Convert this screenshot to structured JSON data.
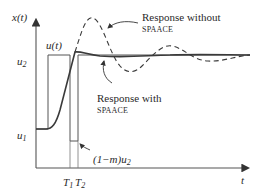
{
  "diagram": {
    "axes": {
      "y_label": "x(t)",
      "x_label": "t"
    },
    "levels": {
      "upper": "u2",
      "lower": "u1",
      "dip": "(1−m)u2"
    },
    "time_marks": [
      "T1",
      "T2"
    ],
    "signal_label": "u(t)",
    "annotations": {
      "without": {
        "line1": "Response without",
        "line2": "SPAACE"
      },
      "with": {
        "line1": "Response with",
        "line2": "SPAACE"
      }
    },
    "colors": {
      "line": "#3a3a3a",
      "axis": "#555555",
      "text": "#2a2a2a"
    }
  }
}
